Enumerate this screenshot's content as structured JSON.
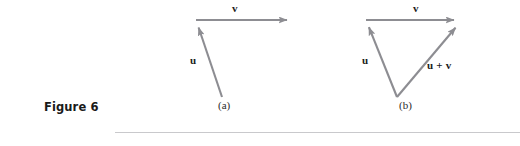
{
  "figure": {
    "label": "Figure 6",
    "panels": [
      {
        "id": "a",
        "caption": "(a)",
        "vectors": [
          {
            "name": "v",
            "label": "v",
            "from": [
              196,
              20
            ],
            "to": [
              295,
              20
            ]
          },
          {
            "name": "u",
            "label": "u",
            "from": [
              222,
              97
            ],
            "to": [
              196,
              20
            ]
          }
        ]
      },
      {
        "id": "b",
        "caption": "(b)",
        "vectors": [
          {
            "name": "v",
            "label": "v",
            "from": [
              366,
              20
            ],
            "to": [
              462,
              20
            ]
          },
          {
            "name": "u",
            "label": "u",
            "from": [
              397,
              97
            ],
            "to": [
              366,
              20
            ]
          },
          {
            "name": "u-plus-v",
            "label": "u + v",
            "from": [
              397,
              97
            ],
            "to": [
              462,
              20
            ]
          }
        ]
      }
    ]
  },
  "style": {
    "vector_color": "#8d8d92",
    "text_color": "#1b1b1b",
    "rule_color": "#c9c9cc",
    "background": "#ffffff"
  }
}
